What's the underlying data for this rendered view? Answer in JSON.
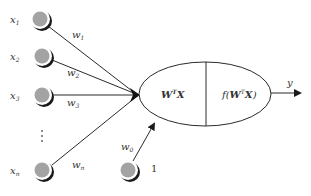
{
  "diagram": {
    "type": "perceptron",
    "inputs": [
      {
        "label": "x",
        "sub": "1",
        "weight": "w",
        "weight_sub": "1",
        "cx": 40,
        "cy": 19,
        "lx": 10,
        "ly": 23,
        "wx": 72,
        "wy": 38
      },
      {
        "label": "x",
        "sub": "2",
        "weight": "w",
        "weight_sub": "2",
        "cx": 42,
        "cy": 56,
        "lx": 10,
        "ly": 60,
        "wx": 67,
        "wy": 76
      },
      {
        "label": "x",
        "sub": "3",
        "weight": "w",
        "weight_sub": "3",
        "cx": 42,
        "cy": 95,
        "lx": 10,
        "ly": 99,
        "wx": 67,
        "wy": 106
      },
      {
        "label": "x",
        "sub": "n",
        "weight": "w",
        "weight_sub": "n",
        "cx": 42,
        "cy": 170,
        "lx": 10,
        "ly": 174,
        "wx": 72,
        "wy": 168
      }
    ],
    "ellipsis": "⋮",
    "bias": {
      "label": "1",
      "weight": "w",
      "weight_sub": "0",
      "cx": 128,
      "cy": 170
    },
    "node": {
      "left_text": "W",
      "left_sup": "T",
      "left_tail": "X",
      "right_prefix": "f(",
      "right_w": "W",
      "right_sup": "T",
      "right_x": "X",
      "right_suffix": ")"
    },
    "output": {
      "label": "y"
    },
    "colors": {
      "node_fill": "#a3a3a3",
      "node_ring": "#ffffff",
      "shadow": "#1a1a1a",
      "line": "#2a2a2a"
    }
  }
}
